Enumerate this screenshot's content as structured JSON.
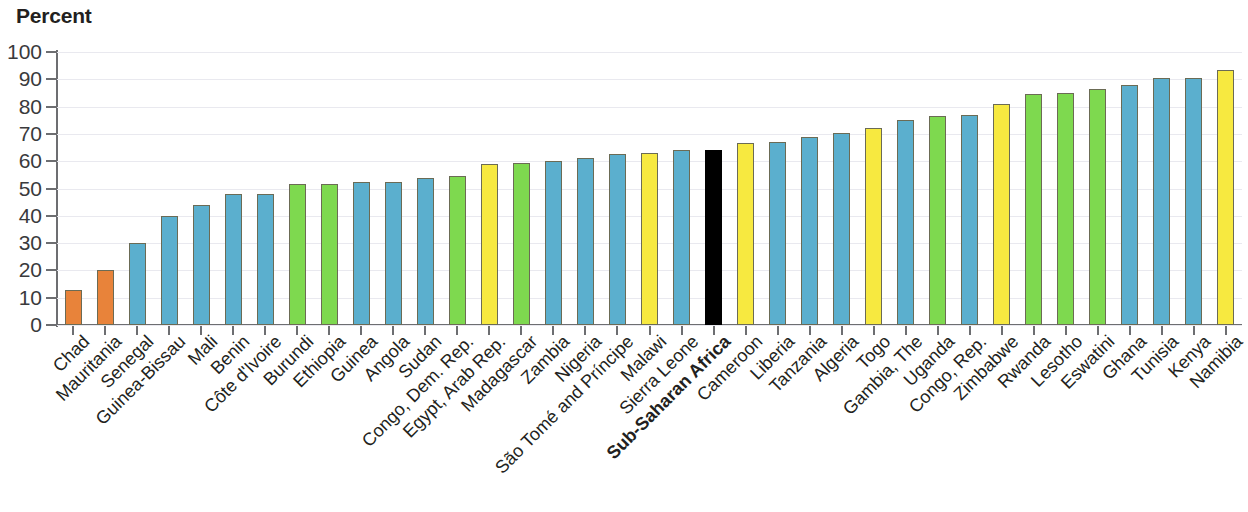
{
  "chart_data": {
    "type": "bar",
    "title": "",
    "ylabel": "Percent",
    "xlabel": "",
    "ylim": [
      0,
      100
    ],
    "ytick_labels": [
      "100",
      "90",
      "80",
      "70",
      "60",
      "50",
      "40",
      "30",
      "20",
      "10",
      "0"
    ],
    "ytick_values": [
      100,
      90,
      80,
      70,
      60,
      50,
      40,
      30,
      20,
      10,
      0
    ],
    "grid": true,
    "legend": "none",
    "highlight_category": "Sub-Saharan Africa",
    "colors": {
      "orange": "#E8833A",
      "blue": "#5BAFCE",
      "green": "#7ED94F",
      "yellow": "#F7E940",
      "black": "#000000",
      "axis": "#6d6e71",
      "gridline": "#e9e9ef",
      "text": "#231f20"
    },
    "categories": [
      "Chad",
      "Mauritania",
      "Senegal",
      "Guinea-Bissau",
      "Mali",
      "Benin",
      "Côte d'Ivoire",
      "Burundi",
      "Ethiopia",
      "Guinea",
      "Angola",
      "Sudan",
      "Congo, Dem. Rep.",
      "Egypt, Arab Rep.",
      "Madagascar",
      "Zambia",
      "Nigeria",
      "São Tomé and Príncipe",
      "Malawi",
      "Sierra Leone",
      "Sub-Saharan Africa",
      "Cameroon",
      "Liberia",
      "Tanzania",
      "Algeria",
      "Togo",
      "Gambia, The",
      "Uganda",
      "Congo, Rep.",
      "Zimbabwe",
      "Rwanda",
      "Lesotho",
      "Eswatini",
      "Ghana",
      "Tunisia",
      "Kenya",
      "Namibia"
    ],
    "values": [
      13,
      20,
      30,
      40,
      44,
      48,
      48,
      51.5,
      51.5,
      52.5,
      52.5,
      54,
      54.5,
      59,
      59.5,
      60,
      61,
      62.5,
      63,
      64,
      64,
      66.5,
      67,
      69,
      70.5,
      72,
      75,
      76.5,
      77,
      81,
      84.5,
      85,
      86.5,
      88,
      90.5,
      90.5,
      93.5
    ],
    "bar_colors": [
      "orange",
      "orange",
      "blue",
      "blue",
      "blue",
      "blue",
      "blue",
      "green",
      "green",
      "blue",
      "blue",
      "blue",
      "green",
      "yellow",
      "green",
      "blue",
      "blue",
      "blue",
      "yellow",
      "blue",
      "black",
      "yellow",
      "blue",
      "blue",
      "blue",
      "yellow",
      "blue",
      "green",
      "blue",
      "yellow",
      "green",
      "green",
      "green",
      "blue",
      "blue",
      "blue",
      "yellow"
    ]
  }
}
